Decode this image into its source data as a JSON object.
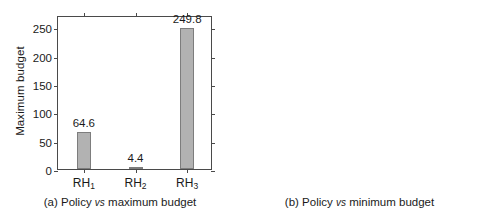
{
  "chart_data": [
    {
      "type": "bar",
      "panel": "a",
      "title": "",
      "caption_prefix": "(a) Policy",
      "caption_vs": "vs",
      "caption_suffix": "maximum budget",
      "xlabel": "",
      "ylabel": "Maximum budget",
      "categories": [
        "RH1",
        "RH2",
        "RH3"
      ],
      "category_labels": [
        {
          "base": "RH",
          "sub": "1"
        },
        {
          "base": "RH",
          "sub": "2"
        },
        {
          "base": "RH",
          "sub": "3"
        }
      ],
      "values": [
        64.6,
        4.4,
        249.8
      ],
      "value_labels": [
        "64.6",
        "4.4",
        "249.8"
      ],
      "yticks": [
        0,
        50,
        100,
        150,
        200,
        250
      ],
      "ytick_labels": [
        "0",
        "50",
        "100",
        "150",
        "200",
        "250"
      ],
      "ylim": [
        0,
        272
      ],
      "grid": false,
      "legend": "none",
      "bar_color": "#b2b2b2",
      "bar_edge_color": "#7d7d7d",
      "axis_color": "#4a4a4a"
    },
    {
      "type": "bar",
      "panel": "b",
      "title": "",
      "caption_prefix": "(b) Policy",
      "caption_vs": "vs",
      "caption_suffix": "minimum budget",
      "xlabel": "",
      "ylabel": "Minimum budget",
      "categories": [
        "RH1",
        "RH2",
        "RH3"
      ],
      "category_labels": [
        {
          "base": "RH",
          "sub": "1"
        },
        {
          "base": "RH",
          "sub": "2"
        },
        {
          "base": "RH",
          "sub": "3"
        }
      ],
      "values": [
        34.5,
        0.76,
        176.2
      ],
      "value_labels": [
        "34.5",
        "0.76",
        "176.2"
      ],
      "yticks": [
        0,
        50,
        100,
        150
      ],
      "ytick_labels": [
        "0",
        "50",
        "100",
        "150"
      ],
      "ylim": [
        0,
        192
      ],
      "grid": false,
      "legend": "none",
      "bar_color": "#b2b2b2",
      "bar_edge_color": "#7d7d7d",
      "axis_color": "#4a4a4a"
    }
  ]
}
